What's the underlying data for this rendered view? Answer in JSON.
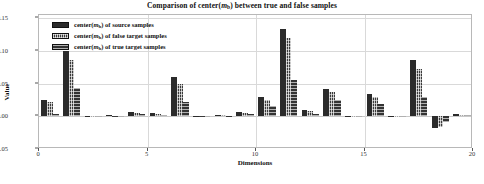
{
  "chart_data": {
    "type": "bar",
    "title_prefix": "Comparison of center(",
    "title_var": "m",
    "title_sub": "b",
    "title_suffix": ") between true and false samples",
    "xlabel": "Dimensions",
    "ylabel": "Value",
    "ylim": [
      -0.05,
      0.155
    ],
    "xlim": [
      0,
      20
    ],
    "grid": true,
    "legend_position": "upper-left",
    "ytick_labels": [
      "0.15",
      "0.10",
      "0.05",
      "0.00",
      "-0.05"
    ],
    "ytick_values": [
      0.15,
      0.1,
      0.05,
      0.0,
      -0.05
    ],
    "xtick_labels": [
      "0",
      "5",
      "10",
      "15",
      "20"
    ],
    "xtick_values": [
      0,
      5,
      10,
      15,
      20
    ],
    "categories": [
      1,
      2,
      3,
      4,
      5,
      6,
      7,
      8,
      9,
      10,
      11,
      12,
      13,
      14,
      15,
      16,
      17,
      18,
      19,
      20
    ],
    "series": [
      {
        "name": "center( m_b ) of source samples",
        "label_prefix": "center(",
        "label_var": "m",
        "label_sub": "b",
        "label_suffix": ") of source samples",
        "color": "#2b2b2b",
        "hatch": "solid",
        "values": [
          0.0245,
          0.1005,
          0.0008,
          0.0015,
          0.0065,
          0.0048,
          0.06,
          0.0012,
          0.0022,
          0.006,
          0.0295,
          0.133,
          0.01,
          0.042,
          0.001,
          0.0335,
          0.0005,
          0.0855,
          -0.0175,
          0.003
        ]
      },
      {
        "name": "center( m_b ) of false target samples",
        "label_prefix": "center(",
        "label_var": "m",
        "label_sub": "b",
        "label_suffix": ") of false target samples",
        "color": "#3a3a3a",
        "hatch": "cross",
        "values": [
          0.0215,
          0.0855,
          0.0006,
          0.0012,
          0.0055,
          0.004,
          0.049,
          0.001,
          0.0018,
          0.005,
          0.0255,
          0.12,
          0.0075,
          0.0365,
          0.0008,
          0.029,
          0.0004,
          0.072,
          -0.016,
          0.0025
        ]
      },
      {
        "name": "center( m_b ) of true target samples",
        "label_prefix": "center(",
        "label_var": "m",
        "label_sub": "b",
        "label_suffix": ") of true target samples",
        "color": "#333333",
        "hatch": "horizontal",
        "values": [
          0.0035,
          0.044,
          0.0004,
          0.0008,
          0.004,
          0.0018,
          0.0215,
          0.0006,
          0.0012,
          0.0035,
          0.016,
          0.056,
          0.0035,
          0.0245,
          0.0005,
          0.019,
          0.0002,
          0.03,
          -0.009,
          0.002
        ]
      }
    ]
  }
}
